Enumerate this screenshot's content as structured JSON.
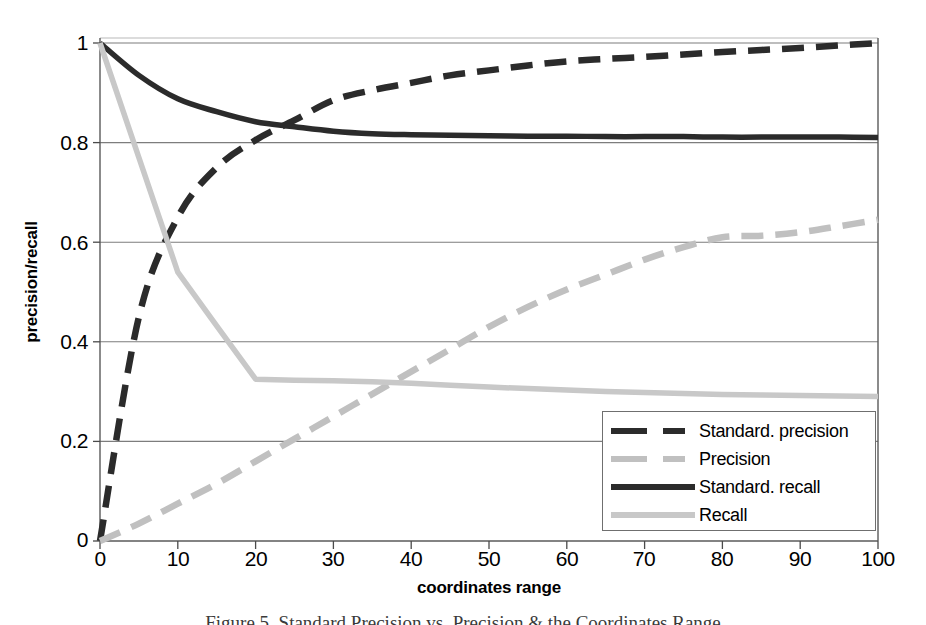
{
  "chart_data": {
    "type": "line",
    "title": "",
    "xlabel": "coordinates range",
    "ylabel": "precision/recall",
    "xlim": [
      0,
      100
    ],
    "ylim": [
      0,
      1
    ],
    "xticks": [
      "0",
      "10",
      "20",
      "30",
      "40",
      "50",
      "60",
      "70",
      "80",
      "90",
      "100"
    ],
    "yticks": [
      "0",
      "0.2",
      "0.4",
      "0.6",
      "0.8",
      "1"
    ],
    "grid": "horizontal",
    "legend_position": "bottom-right",
    "x": [
      0,
      5,
      10,
      15,
      20,
      25,
      30,
      35,
      40,
      45,
      50,
      55,
      60,
      65,
      70,
      75,
      80,
      85,
      90,
      95,
      100
    ],
    "series": [
      {
        "name": "Standard. precision",
        "color": "#2b2b2b",
        "style": "dashed",
        "values": [
          0.0,
          0.45,
          0.65,
          0.75,
          0.805,
          0.845,
          0.885,
          0.905,
          0.92,
          0.935,
          0.945,
          0.955,
          0.963,
          0.968,
          0.972,
          0.977,
          0.982,
          0.986,
          0.99,
          0.995,
          1.0
        ]
      },
      {
        "name": "Precision",
        "color": "#c0c0c0",
        "style": "dashed",
        "values": [
          0.0,
          0.035,
          0.075,
          0.115,
          0.16,
          0.205,
          0.25,
          0.295,
          0.34,
          0.385,
          0.43,
          0.47,
          0.505,
          0.535,
          0.565,
          0.59,
          0.61,
          0.613,
          0.62,
          0.632,
          0.645
        ]
      },
      {
        "name": "Standard. recall",
        "color": "#2b2b2b",
        "style": "solid",
        "values": [
          1.0,
          0.935,
          0.888,
          0.862,
          0.842,
          0.832,
          0.823,
          0.818,
          0.816,
          0.815,
          0.814,
          0.813,
          0.813,
          0.812,
          0.812,
          0.812,
          0.811,
          0.811,
          0.811,
          0.811,
          0.81
        ]
      },
      {
        "name": "Recall",
        "color": "#c8c8c8",
        "style": "solid",
        "values": [
          1.0,
          0.77,
          0.54,
          0.432,
          0.325,
          0.323,
          0.322,
          0.32,
          0.317,
          0.313,
          0.309,
          0.306,
          0.303,
          0.3,
          0.298,
          0.296,
          0.294,
          0.293,
          0.292,
          0.291,
          0.29
        ]
      }
    ]
  },
  "legend": {
    "items": [
      {
        "label": "Standard. precision",
        "color": "#2b2b2b",
        "style": "dashed"
      },
      {
        "label": "Precision",
        "color": "#c0c0c0",
        "style": "dashed"
      },
      {
        "label": "Standard. recall",
        "color": "#2b2b2b",
        "style": "solid"
      },
      {
        "label": "Recall",
        "color": "#c8c8c8",
        "style": "solid"
      }
    ]
  },
  "axes": {
    "y_title": "precision/recall",
    "x_title": "coordinates range",
    "y_tick_labels": [
      "1",
      "0.8",
      "0.6",
      "0.4",
      "0.2",
      "0"
    ],
    "x_tick_labels": [
      "0",
      "10",
      "20",
      "30",
      "40",
      "50",
      "60",
      "70",
      "80",
      "90",
      "100"
    ]
  },
  "caption": "Figure 5. Standard Precision vs. Precision & the Coordinates Range"
}
